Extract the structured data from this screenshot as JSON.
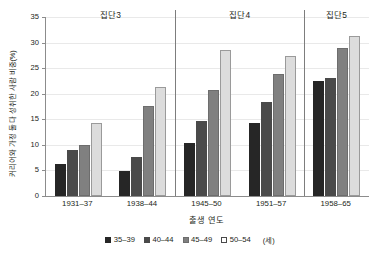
{
  "chart_data": {
    "type": "bar",
    "title": "",
    "xlabel": "출생 연도",
    "ylabel": "커리어와 가정 둘 다 성취한 사람 비중(%)",
    "categories": [
      "1931–37",
      "1938–44",
      "1945–50",
      "1951–57",
      "1958–65"
    ],
    "series": [
      {
        "name": "35–39",
        "values": [
          6.3,
          4.9,
          10.4,
          14.3,
          22.4
        ]
      },
      {
        "name": "40–44",
        "values": [
          9.0,
          7.7,
          14.6,
          18.3,
          23.0
        ]
      },
      {
        "name": "45–49",
        "values": [
          10.0,
          17.6,
          20.7,
          23.8,
          29.0
        ]
      },
      {
        "name": "50–54",
        "values": [
          14.3,
          21.3,
          28.6,
          27.3,
          31.3
        ]
      }
    ],
    "ylim": [
      0,
      35
    ],
    "yticks": [
      0,
      5,
      10,
      15,
      20,
      25,
      30,
      35
    ],
    "ytick_labels": [
      "0",
      "5",
      "10",
      "15",
      "20",
      "25",
      "30",
      "35"
    ],
    "grid": true,
    "legend_position": "bottom",
    "legend_unit": "(세)",
    "panels": [
      {
        "label": "집단3",
        "spans": [
          "1931–37",
          "1938–44"
        ]
      },
      {
        "label": "집단4",
        "spans": [
          "1945–50",
          "1951–57"
        ]
      },
      {
        "label": "집단5",
        "spans": [
          "1958–65"
        ]
      }
    ],
    "panel_separators_after_category_index": [
      1,
      3
    ],
    "colors": {
      "series_35_39": "#262626",
      "series_40_44": "#4a4a4a",
      "series_45_49": "#808080",
      "series_50_54": "#dcdcdc",
      "axis": "#8c8c8c",
      "gridline": "#e9e9e9",
      "separator": "#7d7d7d",
      "text": "#231f20",
      "background": "#ffffff"
    }
  }
}
